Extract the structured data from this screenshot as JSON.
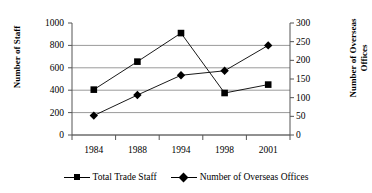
{
  "chart_data": {
    "type": "line",
    "title": "",
    "categories": [
      "1984",
      "1988",
      "1994",
      "1998",
      "2001"
    ],
    "series": [
      {
        "name": "Total Trade Staff",
        "axis": "left",
        "marker": "square",
        "values": [
          405,
          655,
          910,
          375,
          450
        ]
      },
      {
        "name": "Number of Overseas Offices",
        "axis": "right",
        "marker": "diamond",
        "values": [
          52,
          107,
          160,
          172,
          240
        ]
      }
    ],
    "xlabel": "",
    "ylabel": "Number of Staff",
    "y2label": "Number of Overseas Offices",
    "ylim": [
      0,
      1000
    ],
    "y2lim": [
      0,
      300
    ],
    "yticks": [
      0,
      200,
      400,
      600,
      800,
      1000
    ],
    "y2ticks": [
      0,
      50,
      100,
      150,
      200,
      250,
      300
    ],
    "grid": true,
    "legend_position": "bottom"
  },
  "axes": {
    "left_title": "Number of Staff",
    "right_title": "Number of Overseas Offices",
    "left_ticks": [
      "1000",
      "800",
      "600",
      "400",
      "200",
      "0"
    ],
    "right_ticks": [
      "300",
      "250",
      "200",
      "150",
      "100",
      "50",
      "0"
    ],
    "x_ticks": [
      "1984",
      "1988",
      "1994",
      "1998",
      "2001"
    ]
  },
  "legend": {
    "items": [
      {
        "label": "Total Trade Staff",
        "marker": "square-marker"
      },
      {
        "label": "Number of Overseas Offices",
        "marker": "diamond-marker"
      }
    ]
  },
  "colors": {
    "series": "#000000",
    "grid": "#9a9a9a",
    "axis": "#555555",
    "background": "#ffffff"
  }
}
